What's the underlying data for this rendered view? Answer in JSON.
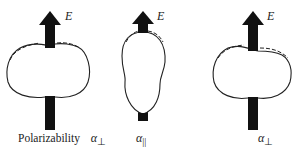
{
  "figure": {
    "panels": [
      {
        "id": "left",
        "field_label": "E",
        "caption_prefix": "Polarizability",
        "symbol": "α",
        "subscript": "⊥",
        "shape": "oblate (wide) polarizability surface with dashed perturbed outline at top"
      },
      {
        "id": "middle",
        "field_label": "E",
        "caption_prefix": "",
        "symbol": "α",
        "subscript": "||",
        "shape": "prolate (elongated) polarizability surface with dashed perturbed outline at top"
      },
      {
        "id": "right",
        "field_label": "E",
        "caption_prefix": "",
        "symbol": "α",
        "subscript": "⊥",
        "shape": "oblate (wide) polarizability surface with dashed perturbed outline at top"
      }
    ],
    "colors": {
      "arrow": "#111111",
      "outline": "#222222",
      "background": "#ffffff"
    }
  }
}
